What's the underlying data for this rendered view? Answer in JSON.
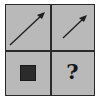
{
  "puzzle": {
    "layout": "2x2 grid",
    "cells": [
      {
        "position": "top-left",
        "content": "arrow",
        "direction": "up-right",
        "size": "long"
      },
      {
        "position": "top-right",
        "content": "arrow",
        "direction": "up-right",
        "size": "short"
      },
      {
        "position": "bottom-left",
        "content": "square",
        "fill": "dark"
      },
      {
        "position": "bottom-right",
        "content": "question-mark",
        "text": "?"
      }
    ]
  },
  "colors": {
    "cell_background": "#b9b9b9",
    "line": "#2a2a2a",
    "shape_fill": "#2b2b2b"
  }
}
